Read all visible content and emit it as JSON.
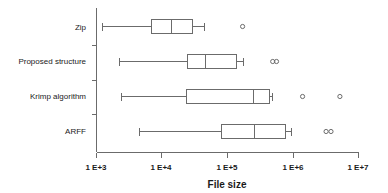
{
  "chart_data": {
    "type": "box",
    "title": "",
    "xlabel": "File size",
    "ylabel": "",
    "xscale": "log",
    "xlim": [
      1000,
      10000000
    ],
    "grid": false,
    "legend": false,
    "axis_ticks": [
      {
        "label": "1 E+3",
        "value": 1000
      },
      {
        "label": "1 E+4",
        "value": 10000
      },
      {
        "label": "1 E+5",
        "value": 100000
      },
      {
        "label": "1 E+6",
        "value": 1000000
      },
      {
        "label": "1 E+7",
        "value": 10000000
      }
    ],
    "categories": [
      "Zip",
      "Proposed structure",
      "Krimp algorithm",
      "ARFF"
    ],
    "boxes": [
      {
        "category": "Zip",
        "whisker_low": 1200,
        "q1": 6800,
        "median": 13500,
        "q3": 29000,
        "whisker_high": 44000,
        "outliers": [
          170000
        ]
      },
      {
        "category": "Proposed structure",
        "whisker_low": 2200,
        "q1": 24500,
        "median": 46000,
        "q3": 135000,
        "whisker_high": 175000,
        "outliers": [
          490000,
          560000
        ]
      },
      {
        "category": "Krimp algorithm",
        "whisker_low": 2400,
        "q1": 23000,
        "median": 245000,
        "q3": 420000,
        "whisker_high": 470000,
        "outliers": [
          1400000,
          5200000
        ]
      },
      {
        "category": "ARFF",
        "whisker_low": 4400,
        "q1": 79000,
        "median": 250000,
        "q3": 740000,
        "whisker_high": 920000,
        "outliers": [
          3200000,
          3800000
        ]
      }
    ]
  },
  "colors": {
    "line": "#6b6b6b",
    "text": "#1a1a1a",
    "background": "#ffffff"
  }
}
